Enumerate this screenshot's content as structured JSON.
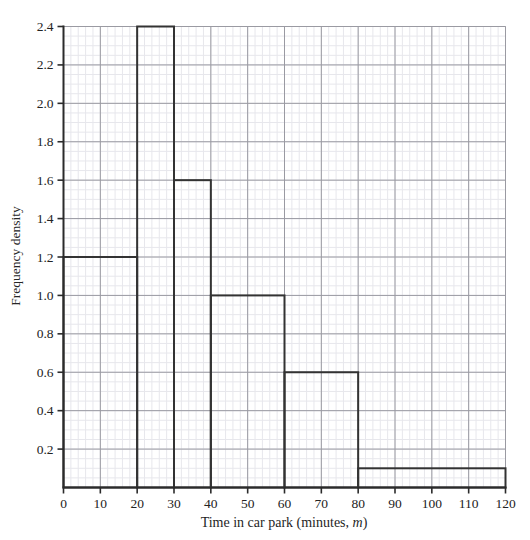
{
  "figure": {
    "clipped_header": "",
    "background_color": "#ffffff",
    "grid": {
      "minor_color": "#e7e7ec",
      "major_color": "#9a9aa2",
      "minor_on": true,
      "major_on": true
    },
    "axis_color": "#2b2b2b",
    "bar_color": "#333333"
  },
  "chart_data": {
    "type": "bar",
    "title": "",
    "subtitle": "",
    "xlabel": "Time in car park (minutes, m)",
    "xlabel_plain": "Time in car park (minutes, ",
    "xlabel_italic": "m",
    "xlabel_tail": ")",
    "ylabel": "Frequency density",
    "xlim": [
      0,
      120
    ],
    "ylim": [
      0,
      2.4
    ],
    "xticks": [
      0,
      10,
      20,
      30,
      40,
      50,
      60,
      70,
      80,
      90,
      100,
      110,
      120
    ],
    "xtick_labels": [
      "0",
      "10",
      "20",
      "30",
      "40",
      "50",
      "60",
      "70",
      "80",
      "90",
      "100",
      "110",
      "120"
    ],
    "yticks": [
      0.2,
      0.4,
      0.6,
      0.8,
      1.0,
      1.2,
      1.4,
      1.6,
      1.8,
      2.0,
      2.2,
      2.4
    ],
    "ytick_labels": [
      "0.2",
      "0.4",
      "0.6",
      "0.8",
      "1.0",
      "1.2",
      "1.4",
      "1.6",
      "1.8",
      "2.0",
      "2.2",
      "2.4"
    ],
    "minor_x_step": 2,
    "minor_y_step": 0.05,
    "grid": true,
    "legend": null,
    "bins": [
      {
        "label": "0 ≤ m < 20",
        "x_start": 0,
        "x_end": 20,
        "frequency_density": 1.2,
        "frequency": 24
      },
      {
        "label": "20 ≤ m < 30",
        "x_start": 20,
        "x_end": 30,
        "frequency_density": 2.4,
        "frequency": 24
      },
      {
        "label": "30 ≤ m < 40",
        "x_start": 30,
        "x_end": 40,
        "frequency_density": 1.6,
        "frequency": 16
      },
      {
        "label": "40 ≤ m < 60",
        "x_start": 40,
        "x_end": 60,
        "frequency_density": 1.0,
        "frequency": 20
      },
      {
        "label": "60 ≤ m < 80",
        "x_start": 60,
        "x_end": 80,
        "frequency_density": 0.6,
        "frequency": 12
      },
      {
        "label": "80 ≤ m < 120",
        "x_start": 80,
        "x_end": 120,
        "frequency_density": 0.1,
        "frequency": 4
      }
    ],
    "categories": [
      "0-20",
      "20-30",
      "30-40",
      "40-60",
      "60-80",
      "80-120"
    ],
    "values": [
      1.2,
      2.4,
      1.6,
      1.0,
      0.6,
      0.1
    ]
  }
}
